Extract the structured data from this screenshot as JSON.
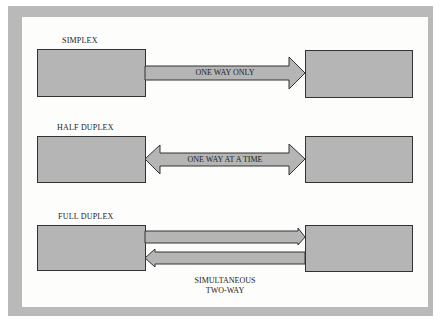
{
  "diagram": {
    "type": "communication-modes",
    "colors": {
      "frame": "#b9b9b9",
      "panel": "#fdfdfb",
      "box_fill": "#b5b5b5",
      "outline": "#333333"
    },
    "sections": [
      {
        "title": "SIMPLEX",
        "arrow_label": "ONE WAY ONLY",
        "direction": "left-to-right"
      },
      {
        "title": "HALF DUPLEX",
        "arrow_label": "ONE WAY AT A TIME",
        "direction": "bidirectional-single-channel"
      },
      {
        "title": "FULL DUPLEX",
        "arrow_label_line1": "SIMULTANEOUS",
        "arrow_label_line2": "TWO-WAY",
        "direction": "two-channels"
      }
    ]
  }
}
